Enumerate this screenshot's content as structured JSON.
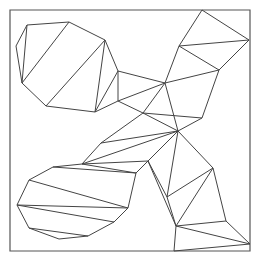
{
  "diagram": {
    "type": "triangulated-polygon",
    "background": "#ffffff",
    "stroke_color": "#444444",
    "frame": {
      "x": 10,
      "y": 10,
      "width": 240,
      "height": 241,
      "stroke": "#555555"
    },
    "vertices": {
      "a": [
        27,
        25
      ],
      "b": [
        69,
        22
      ],
      "c": [
        16,
        46
      ],
      "d": [
        105,
        40
      ],
      "e": [
        22,
        83
      ],
      "f": [
        46,
        106
      ],
      "g": [
        95,
        112
      ],
      "h": [
        118,
        71
      ],
      "i": [
        118,
        101
      ],
      "j": [
        143,
        113
      ],
      "k": [
        165,
        83
      ],
      "l": [
        179,
        46
      ],
      "m": [
        202,
        10
      ],
      "n": [
        249,
        40
      ],
      "o": [
        219,
        70
      ],
      "p": [
        202,
        118
      ],
      "q": [
        178,
        131
      ],
      "r": [
        101,
        143
      ],
      "s": [
        82,
        164
      ],
      "t": [
        148,
        161
      ],
      "u": [
        136,
        173
      ],
      "v": [
        53,
        167
      ],
      "w": [
        29,
        180
      ],
      "x": [
        17,
        205
      ],
      "y": [
        128,
        208
      ],
      "z": [
        29,
        228
      ],
      "aa": [
        59,
        239
      ],
      "ab": [
        88,
        236
      ],
      "ac": [
        114,
        222
      ],
      "ad": [
        213,
        168
      ],
      "ae": [
        167,
        197
      ],
      "af": [
        176,
        226
      ],
      "ag": [
        226,
        221
      ],
      "ah": [
        250,
        244
      ],
      "ai": [
        174,
        251
      ]
    },
    "edges": [
      [
        "a",
        "b"
      ],
      [
        "a",
        "c"
      ],
      [
        "c",
        "e"
      ],
      [
        "a",
        "e"
      ],
      [
        "b",
        "e"
      ],
      [
        "b",
        "d"
      ],
      [
        "e",
        "f"
      ],
      [
        "f",
        "d"
      ],
      [
        "f",
        "g"
      ],
      [
        "d",
        "g"
      ],
      [
        "d",
        "h"
      ],
      [
        "h",
        "g"
      ],
      [
        "h",
        "i"
      ],
      [
        "g",
        "i"
      ],
      [
        "i",
        "j"
      ],
      [
        "i",
        "k"
      ],
      [
        "h",
        "k"
      ],
      [
        "j",
        "k"
      ],
      [
        "k",
        "l"
      ],
      [
        "l",
        "m"
      ],
      [
        "m",
        "n"
      ],
      [
        "l",
        "n"
      ],
      [
        "l",
        "o"
      ],
      [
        "n",
        "o"
      ],
      [
        "k",
        "o"
      ],
      [
        "o",
        "p"
      ],
      [
        "k",
        "q"
      ],
      [
        "p",
        "q"
      ],
      [
        "j",
        "q"
      ],
      [
        "j",
        "p"
      ],
      [
        "j",
        "r"
      ],
      [
        "q",
        "r"
      ],
      [
        "r",
        "s"
      ],
      [
        "q",
        "s"
      ],
      [
        "s",
        "t"
      ],
      [
        "q",
        "t"
      ],
      [
        "t",
        "u"
      ],
      [
        "s",
        "u"
      ],
      [
        "s",
        "v"
      ],
      [
        "v",
        "u"
      ],
      [
        "v",
        "w"
      ],
      [
        "w",
        "y"
      ],
      [
        "u",
        "y"
      ],
      [
        "w",
        "x"
      ],
      [
        "x",
        "y"
      ],
      [
        "x",
        "ac"
      ],
      [
        "x",
        "z"
      ],
      [
        "z",
        "ab"
      ],
      [
        "z",
        "aa"
      ],
      [
        "aa",
        "ab"
      ],
      [
        "ab",
        "ac"
      ],
      [
        "ac",
        "y"
      ],
      [
        "u",
        "y"
      ],
      [
        "q",
        "ad"
      ],
      [
        "q",
        "ae"
      ],
      [
        "t",
        "ae"
      ],
      [
        "ad",
        "ae"
      ],
      [
        "ad",
        "af"
      ],
      [
        "ae",
        "af"
      ],
      [
        "ad",
        "ag"
      ],
      [
        "af",
        "ag"
      ],
      [
        "ag",
        "ah"
      ],
      [
        "af",
        "ah"
      ],
      [
        "af",
        "ai"
      ],
      [
        "ai",
        "ah"
      ],
      [
        "t",
        "af"
      ]
    ]
  }
}
